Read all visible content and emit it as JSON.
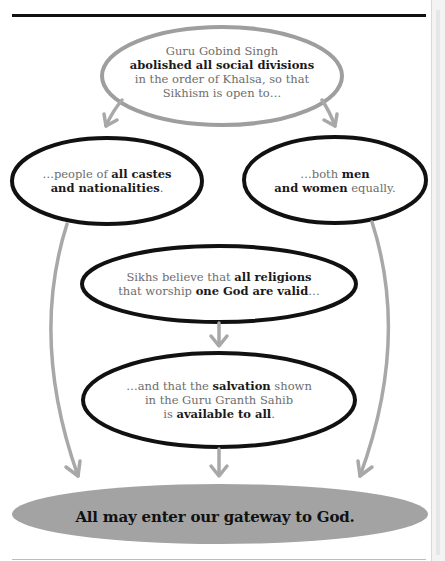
{
  "diagram": {
    "colors": {
      "top_outline": "#9e9e9e",
      "node_outline": "#111111",
      "arrow": "#a8a8a8",
      "final_fill": "#a3a3a3",
      "text_regular": "#6d6d6d",
      "text_bold": "#1a1a1a"
    },
    "nodes": {
      "top": {
        "line1": "Guru Gobind Singh",
        "line2_bold": "abolished all social divisions",
        "line3": "in the order of Khalsa, so that",
        "line4": "Sikhism is open to…"
      },
      "left": {
        "pre": "…people of ",
        "bold1": "all castes",
        "bold2": "and nationalities",
        "post": "."
      },
      "right": {
        "pre": "…both ",
        "bold1": "men",
        "bold2": "and women",
        "post": " equally."
      },
      "middle": {
        "pre1": "Sikhs believe that ",
        "bold1": "all religions",
        "pre2": "that worship ",
        "bold2": "one God are valid",
        "post2": "…"
      },
      "lower": {
        "pre1": "…and that the ",
        "bold1": "salvation",
        "post1": " shown",
        "line2": "in the Guru Granth Sahib",
        "pre3": "is ",
        "bold3": "available to all",
        "post3": "."
      },
      "final": {
        "text": "All may enter our gateway to God."
      }
    }
  }
}
